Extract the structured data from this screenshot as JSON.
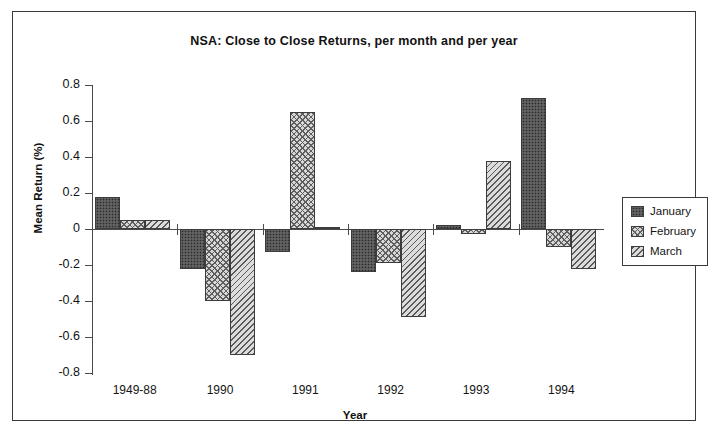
{
  "chart_data": {
    "type": "bar",
    "title": "NSA: Close to Close Returns, per month and per year",
    "xlabel": "Year",
    "ylabel": "Mean Return (%)",
    "categories": [
      "1949-88",
      "1990",
      "1991",
      "1992",
      "1993",
      "1994"
    ],
    "ylim": [
      -0.8,
      0.8
    ],
    "yticks": [
      "0.8",
      "0.6",
      "0.4",
      "0.2",
      "0",
      "-0.2",
      "-0.4",
      "-0.6",
      "-0.8"
    ],
    "ytick_values": [
      0.8,
      0.6,
      0.4,
      0.2,
      0,
      -0.2,
      -0.4,
      -0.6,
      -0.8
    ],
    "grid": false,
    "legend_position": "right",
    "series": [
      {
        "name": "January",
        "pattern": "dense-dotted-dark",
        "values": [
          0.18,
          -0.22,
          -0.13,
          -0.24,
          0.02,
          0.73
        ]
      },
      {
        "name": "February",
        "pattern": "cross-hatch",
        "values": [
          0.05,
          -0.4,
          0.65,
          -0.19,
          -0.03,
          -0.1
        ]
      },
      {
        "name": "March",
        "pattern": "diagonal-hatch",
        "values": [
          0.05,
          -0.7,
          0.01,
          -0.49,
          0.38,
          -0.22
        ]
      }
    ]
  },
  "legend": {
    "items": [
      {
        "label": "January"
      },
      {
        "label": "February"
      },
      {
        "label": "March"
      }
    ]
  }
}
